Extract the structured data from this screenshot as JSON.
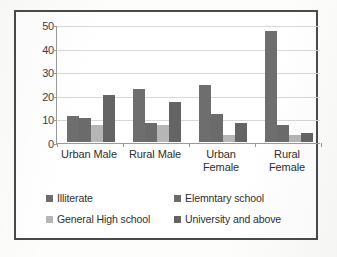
{
  "chart_data": {
    "type": "bar",
    "title": "",
    "subtitle": "",
    "xlabel": "",
    "ylabel": "",
    "categories": [
      "Urban Male",
      "Rural Male",
      "Urban Female",
      "Rural Female"
    ],
    "series": [
      {
        "name": "Illiterate",
        "color": "#6e6e6e",
        "values": [
          11,
          22.5,
          24,
          47
        ]
      },
      {
        "name": "Elemntary school",
        "color": "#6b6b6b",
        "values": [
          10,
          8,
          12,
          7
        ]
      },
      {
        "name": "General High school",
        "color": "#b6b6b6",
        "values": [
          7,
          7,
          3,
          3
        ]
      },
      {
        "name": "University and above",
        "color": "#646464",
        "values": [
          20,
          17,
          8,
          4
        ]
      }
    ],
    "ylim": [
      0,
      50
    ],
    "yticks": [
      0,
      10,
      20,
      30,
      40,
      50
    ],
    "ytick_labels": [
      "0",
      "10",
      "20",
      "30",
      "40",
      "50"
    ],
    "grid": true,
    "grid_axis": "y",
    "legend_position": "bottom",
    "orientation": "vertical",
    "grouping": "clustered"
  },
  "axes": {
    "y_tick_labels": [
      "50",
      "40",
      "30",
      "20",
      "10",
      "0"
    ]
  },
  "legend": {
    "items": [
      {
        "label": "Illiterate",
        "color": "#6e6e6e"
      },
      {
        "label": "Elemntary school",
        "color": "#6b6b6b"
      },
      {
        "label": "General High school",
        "color": "#b6b6b6"
      },
      {
        "label": "University and above",
        "color": "#646464"
      }
    ]
  },
  "frame": {
    "border_color": "#4a4a4a",
    "background": "#ffffff"
  }
}
